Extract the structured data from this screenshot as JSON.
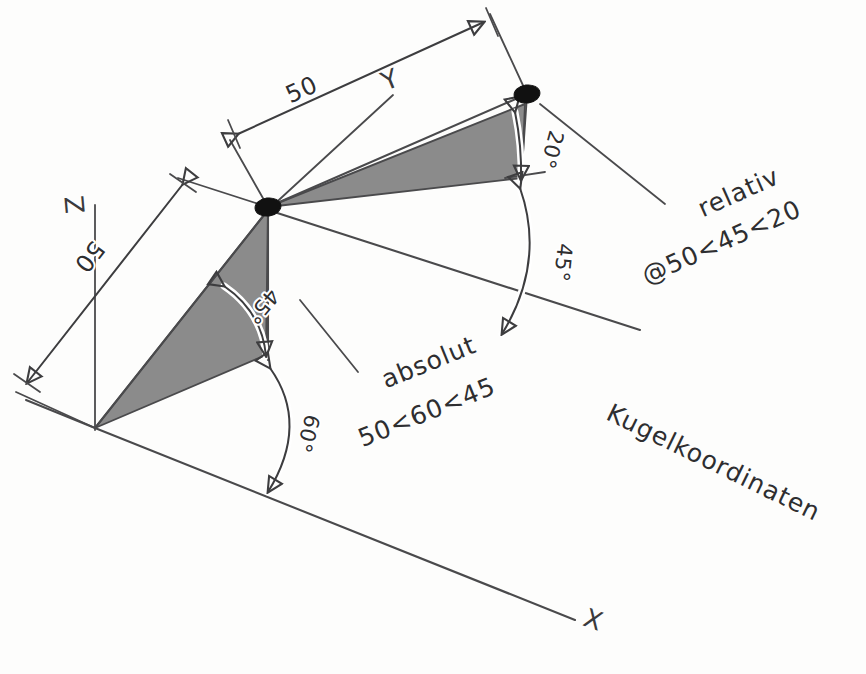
{
  "drawing": {
    "title_note": "Kugelkoordinaten",
    "background_color": "#fdfdfc",
    "ink_color": "#4a4a4c",
    "shade_color": "#8b8b8b",
    "node_color": "#111111",
    "axes": [
      {
        "name": "x-axis",
        "label": "X"
      },
      {
        "name": "y-axis",
        "label": "Y"
      },
      {
        "name": "z-axis",
        "label": "Z"
      }
    ],
    "dimensions": [
      {
        "name": "dimension-upper",
        "value": "50"
      },
      {
        "name": "dimension-left",
        "value": "50"
      }
    ],
    "angles": [
      {
        "name": "angle-20",
        "value": "20°"
      },
      {
        "name": "angle-45-upper",
        "value": "45°"
      },
      {
        "name": "angle-45-lower",
        "value": "45°"
      },
      {
        "name": "angle-60",
        "value": "60°"
      }
    ],
    "annotations": [
      {
        "name": "absolute-annotation",
        "line1": "absolut",
        "line2": "50<60<45"
      },
      {
        "name": "relative-annotation",
        "line1": "relativ",
        "line2": "@50<45<20"
      },
      {
        "name": "caption",
        "line1": "Kugelkoordinaten"
      }
    ],
    "nodes": [
      {
        "name": "origin-node"
      },
      {
        "name": "endpoint-node"
      }
    ]
  }
}
